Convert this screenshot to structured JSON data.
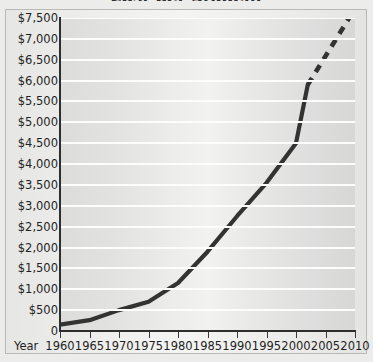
{
  "chart_data": {
    "type": "line",
    "title": "Cost per Student",
    "xlabel": "Year",
    "ylabel": "",
    "xlim": [
      1960,
      2010
    ],
    "ylim": [
      0,
      7500
    ],
    "ytick_step": 500,
    "xtick_step": 5,
    "grid": true,
    "legend": "none",
    "x_tick_labels": [
      "1960",
      "1965",
      "1970",
      "1975",
      "1980",
      "1985",
      "1990",
      "1995",
      "2000",
      "2005",
      "2010"
    ],
    "y_tick_labels": [
      "0",
      "$500",
      "$1,000",
      "$1,500",
      "$2,000",
      "$2,500",
      "$3,000",
      "$3,500",
      "$4,000",
      "$4,500",
      "$5,000",
      "$5,500",
      "$6,000",
      "$6,500",
      "$7,000",
      "$7,500"
    ],
    "y_tick_values": [
      0,
      500,
      1000,
      1500,
      2000,
      2500,
      3000,
      3500,
      4000,
      4500,
      5000,
      5500,
      6000,
      6500,
      7000,
      7500
    ],
    "series": [
      {
        "name": "Actual",
        "style": "solid",
        "color": "#333333",
        "x": [
          1960,
          1965,
          1970,
          1975,
          1980,
          1985,
          1990,
          1995,
          2000,
          2002
        ],
        "values": [
          150,
          260,
          500,
          700,
          1150,
          1900,
          2750,
          3550,
          4500,
          5900
        ]
      },
      {
        "name": "Projected",
        "style": "dashed",
        "color": "#333333",
        "x": [
          2002,
          2009
        ],
        "values": [
          5900,
          7500
        ]
      }
    ]
  },
  "colors": {
    "line": "#333333",
    "gridline": "#fdfdfd",
    "axis": "#2e2e2e",
    "plot_background": "#e7e7e5",
    "page_background": "#ececeb",
    "text": "#1f1f1f"
  }
}
